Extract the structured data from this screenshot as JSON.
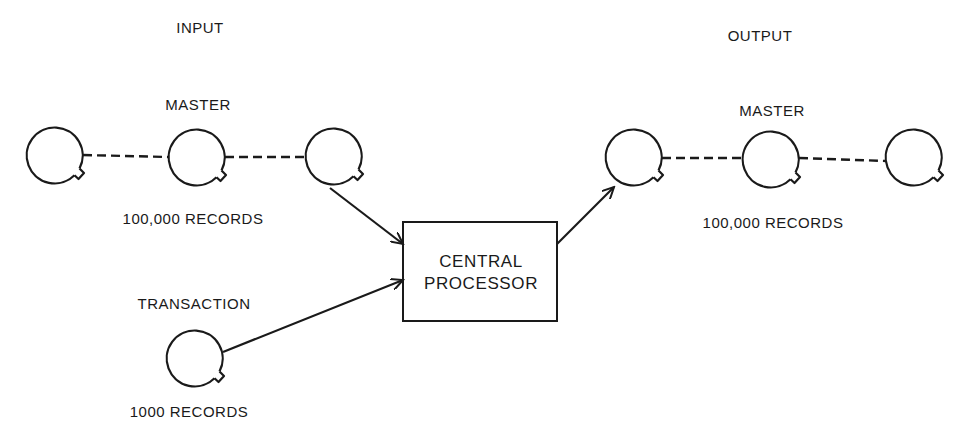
{
  "diagram": {
    "sections": {
      "input": "INPUT",
      "output": "OUTPUT"
    },
    "input_master": {
      "label": "MASTER",
      "records": "100,000 RECORDS",
      "reels": 3
    },
    "transaction": {
      "label": "TRANSACTION",
      "records": "1000 RECORDS",
      "reels": 1
    },
    "processor": {
      "line1": "CENTRAL",
      "line2": "PROCESSOR"
    },
    "output_master": {
      "label": "MASTER",
      "records": "100,000 RECORDS",
      "reels": 3
    },
    "edges": [
      {
        "from": "input_master",
        "to": "processor",
        "type": "arrow"
      },
      {
        "from": "transaction",
        "to": "processor",
        "type": "arrow"
      },
      {
        "from": "processor",
        "to": "output_master",
        "type": "arrow"
      }
    ],
    "colors": {
      "stroke": "#1a1a1a",
      "background": "#ffffff"
    }
  }
}
